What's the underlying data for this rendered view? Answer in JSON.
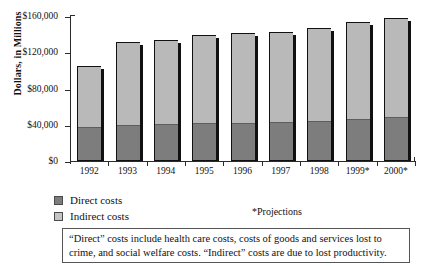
{
  "chart_data": {
    "type": "bar",
    "subtype": "stacked",
    "title": "",
    "xlabel": "",
    "ylabel": "Dollars, in Millions",
    "categories": [
      "1992",
      "1993",
      "1994",
      "1995",
      "1996",
      "1997",
      "1998",
      "1999*",
      "2000*"
    ],
    "series": [
      {
        "name": "Direct costs",
        "color": "#7d7d7d",
        "values": [
          36000,
          39000,
          40000,
          41000,
          41000,
          42000,
          43000,
          45000,
          48000
        ]
      },
      {
        "name": "Indirect costs",
        "color": "#b9b9b9",
        "values": [
          69000,
          92000,
          94000,
          98000,
          100000,
          100000,
          104000,
          108000,
          110000
        ]
      }
    ],
    "totals": [
      105000,
      131000,
      134000,
      139000,
      141000,
      142000,
      147000,
      153000,
      158000
    ],
    "ylim": [
      0,
      160000
    ],
    "yticks": [
      0,
      40000,
      80000,
      120000,
      160000
    ],
    "ytick_labels": [
      "$0",
      "$40,000",
      "$80,000",
      "$120,000",
      "$160,000"
    ],
    "grid": false,
    "legend_position": "bottom-left"
  },
  "axis": {
    "y_title": "Dollars, in Millions",
    "y_tick_labels": [
      "$160,000",
      "$120,000",
      "$80,000",
      "$40,000",
      "$0"
    ],
    "x_tick_labels": [
      "1992",
      "1993",
      "1994",
      "1995",
      "1996",
      "1997",
      "1998",
      "1999*",
      "2000*"
    ]
  },
  "legend": {
    "items": [
      {
        "label": "Direct costs",
        "color": "#7d7d7d"
      },
      {
        "label": "Indirect costs",
        "color": "#c4c4c4"
      }
    ]
  },
  "notes": {
    "projections": "*Projections",
    "footnote": "“Direct” costs include health care costs, costs of goods and services lost to crime, and social welfare costs. “Indirect” costs are due to lost productivity."
  },
  "colors": {
    "direct": "#7d7d7d",
    "indirect": "#b9b9b9",
    "axis": "#2b2b2b",
    "text": "#111111",
    "background": "#ffffff"
  }
}
